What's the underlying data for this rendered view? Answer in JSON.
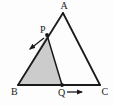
{
  "figure": {
    "background_color": "#fdfdfd",
    "stroke_color": "#1a1a1a",
    "shaded_region_color": "#cccccc",
    "shaded_region_name": "triangle-BPQ"
  },
  "vertices": {
    "A": {
      "label": "A",
      "x": 63,
      "y": 13,
      "label_x": 60.5,
      "label_y": 9
    },
    "B": {
      "label": "B",
      "x": 18,
      "y": 85,
      "label_x": 11,
      "label_y": 95
    },
    "C": {
      "label": "C",
      "x": 100,
      "y": 85,
      "label_x": 101.5,
      "label_y": 95
    },
    "P": {
      "label": "P",
      "x": 47,
      "y": 35,
      "label_x": 40,
      "label_y": 33
    },
    "Q": {
      "label": "Q",
      "x": 62,
      "y": 85,
      "label_x": 58,
      "label_y": 96
    }
  },
  "segments": [
    {
      "name": "side-AB",
      "from": "A",
      "to": "B"
    },
    {
      "name": "side-AC",
      "from": "A",
      "to": "C"
    },
    {
      "name": "side-BC",
      "from": "B",
      "to": "C"
    },
    {
      "name": "segment-PQ",
      "from": "P",
      "to": "Q"
    }
  ],
  "arrows": [
    {
      "name": "arrow-at-P",
      "direction": "down-left",
      "x1": 44,
      "y1": 38,
      "x2": 30,
      "y2": 49
    },
    {
      "name": "arrow-at-Q",
      "direction": "right",
      "x1": 67,
      "y1": 92,
      "x2": 82,
      "y2": 92
    }
  ]
}
